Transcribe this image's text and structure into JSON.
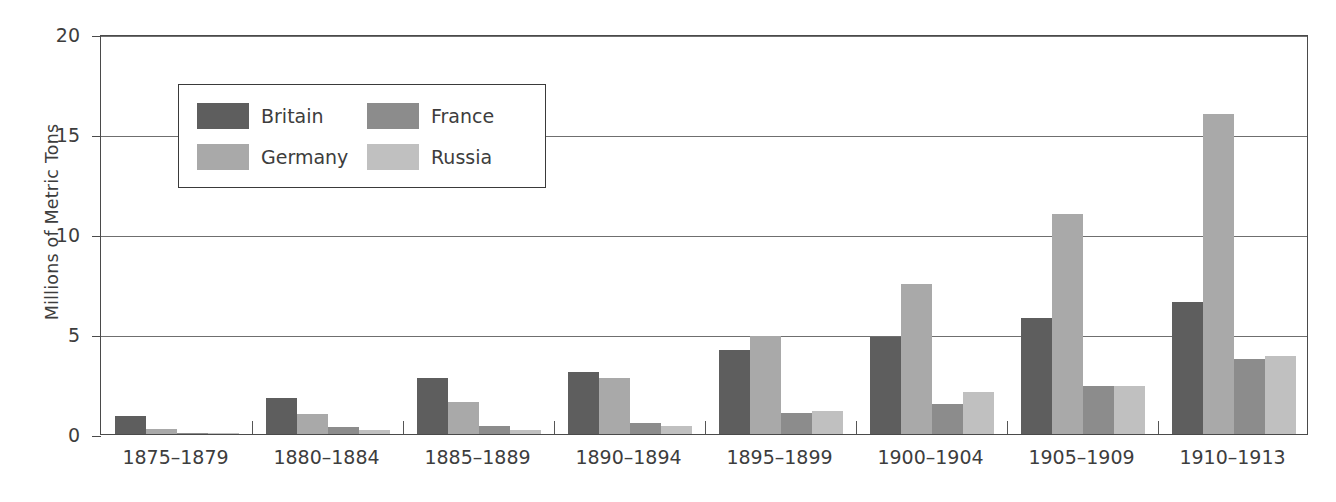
{
  "chart_data": {
    "type": "bar",
    "title": "",
    "xlabel": "",
    "ylabel": "Millions of Metric Tons",
    "ylim": [
      0,
      20
    ],
    "yticks": [
      0,
      5,
      10,
      15,
      20
    ],
    "grid": true,
    "legend_position": "upper-left-inside",
    "categories": [
      "1875–1879",
      "1880–1884",
      "1885–1889",
      "1890–1894",
      "1895–1899",
      "1900–1904",
      "1905–1909",
      "1910–1913"
    ],
    "series": [
      {
        "name": "Britain",
        "color": "#5e5e5e",
        "values": [
          0.9,
          1.8,
          2.8,
          3.1,
          4.2,
          4.85,
          5.8,
          6.6
        ]
      },
      {
        "name": "Germany",
        "color": "#a9a9a9",
        "values": [
          0.25,
          1.0,
          1.6,
          2.8,
          4.9,
          7.5,
          11.0,
          16.0
        ]
      },
      {
        "name": "France",
        "color": "#8c8c8c",
        "values": [
          0.05,
          0.35,
          0.4,
          0.55,
          1.05,
          1.5,
          2.4,
          3.75
        ]
      },
      {
        "name": "Russia",
        "color": "#c0c0c0",
        "values": [
          0.02,
          0.2,
          0.18,
          0.4,
          1.15,
          2.1,
          2.4,
          3.9
        ]
      }
    ]
  },
  "axis": {
    "y_title": "Millions of Metric Tons",
    "y_tick_labels": [
      "0",
      "5",
      "10",
      "15",
      "20"
    ]
  },
  "legend": {
    "entries": [
      {
        "label": "Britain",
        "color": "#5e5e5e"
      },
      {
        "label": "France",
        "color": "#8c8c8c"
      },
      {
        "label": "Germany",
        "color": "#a9a9a9"
      },
      {
        "label": "Russia",
        "color": "#c0c0c0"
      }
    ]
  },
  "style": {
    "frame_color": "#4a4a4a",
    "grid_color": "#6f6f6f",
    "text_color": "#3d3d3d",
    "background": "#ffffff"
  }
}
